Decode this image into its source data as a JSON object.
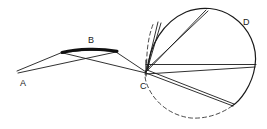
{
  "figure": {
    "type": "optics-ray-diagram",
    "background_color": "#ffffff",
    "stroke_color": "#1a1a1a",
    "width": 267,
    "height": 129
  },
  "labels": {
    "a": "A",
    "b": "B",
    "c": "C",
    "d": "D"
  },
  "label_positions": {
    "a": {
      "x": 20,
      "y": 86
    },
    "b": {
      "x": 88,
      "y": 43
    },
    "c": {
      "x": 140,
      "y": 89
    },
    "d": {
      "x": 243,
      "y": 25
    }
  },
  "points": {
    "a": {
      "x": 17,
      "y": 72
    },
    "c": {
      "x": 146,
      "y": 73
    },
    "mirror_b_left": {
      "x": 62,
      "y": 52
    },
    "mirror_b_right": {
      "x": 117,
      "y": 51
    },
    "circle_top": {
      "x": 205,
      "y": 9
    },
    "circle_right": {
      "x": 256,
      "y": 64
    },
    "circle_bottom_right": {
      "x": 232,
      "y": 105
    }
  },
  "circle_d": {
    "center_x": 201,
    "center_y": 64,
    "radius": 55,
    "solid_arc": "upper-left through right to lower-right",
    "dashed_arc": "lower-left completion"
  },
  "mirror_b": {
    "shape": "thick-shallow-convex-arc",
    "thickness": 3
  },
  "rays": {
    "a_to_b_count": 2,
    "b_to_c_count": 2,
    "c_to_circle_upper_count": 2,
    "c_to_circle_lower_count": 2,
    "c_horizontal_axis": true
  }
}
